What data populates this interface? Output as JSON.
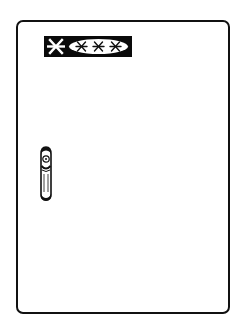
{
  "illustration": {
    "top_caption_fragment": "",
    "door": {
      "label": {
        "freezer_symbol": "snowflake-icon",
        "star_rating_count": 3,
        "star_symbol": "asterisk-star-icon"
      },
      "handle": "door-handle"
    },
    "colors": {
      "ink": "#111111",
      "paper": "#ffffff",
      "label_fill": "#0a0a0a"
    }
  }
}
